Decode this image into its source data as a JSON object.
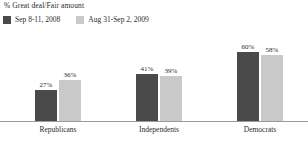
{
  "chart_data": {
    "type": "bar",
    "title": "% Great deal/Fair amount",
    "xlabel": "",
    "ylabel": "",
    "ylim": [
      0,
      100
    ],
    "grid": false,
    "legend_position": "top-left",
    "categories": [
      "Republicans",
      "Independents",
      "Democrats"
    ],
    "series": [
      {
        "name": "Sep 8-11, 2008",
        "color": "#4a4a4a",
        "values": [
          27,
          41,
          60
        ],
        "labels": [
          "27%",
          "41%",
          "60%"
        ]
      },
      {
        "name": "Aug 31-Sep 2, 2009",
        "color": "#c9c9c9",
        "values": [
          36,
          39,
          58
        ],
        "labels": [
          "36%",
          "39%",
          "58%"
        ]
      }
    ]
  },
  "colors": {
    "series_1": "#4a4a4a",
    "series_2": "#c9c9c9",
    "axis": "#9a9a9a",
    "text": "#2b2b2b",
    "background": "#ffffff"
  }
}
